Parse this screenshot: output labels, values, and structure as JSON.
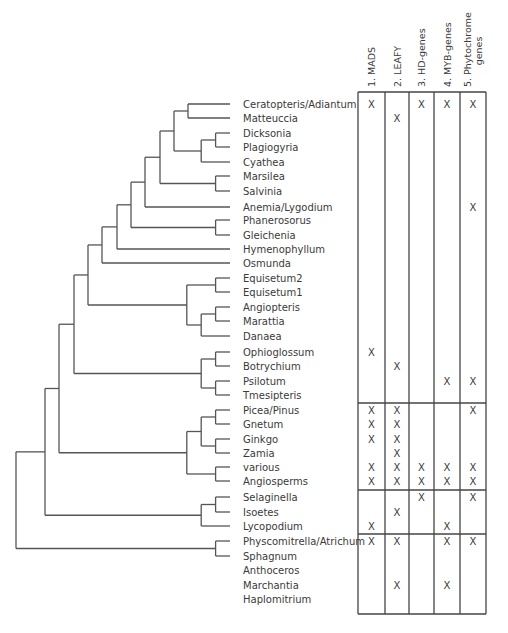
{
  "figure": {
    "type": "phylogenetic-tree-with-gene-matrix",
    "columns": [
      {
        "id": "mads",
        "label": "1. MADS"
      },
      {
        "id": "leafy",
        "label": "2. LEAFY"
      },
      {
        "id": "hd",
        "label": "3. HD-genes"
      },
      {
        "id": "myb",
        "label": "4. MYB-genes"
      },
      {
        "id": "phy",
        "label_line1": "5. Phytochrome",
        "label_line2": "genes"
      }
    ],
    "mark_symbol": "X",
    "taxa": [
      {
        "name": "Ceratopteris/Adiantum",
        "marks": [
          1,
          0,
          1,
          1,
          1
        ]
      },
      {
        "name": "Matteuccia",
        "marks": [
          0,
          1,
          0,
          0,
          0
        ]
      },
      {
        "name": "Dicksonia",
        "marks": [
          0,
          0,
          0,
          0,
          0
        ]
      },
      {
        "name": "Plagiogyria",
        "marks": [
          0,
          0,
          0,
          0,
          0
        ]
      },
      {
        "name": "Cyathea",
        "marks": [
          0,
          0,
          0,
          0,
          0
        ]
      },
      {
        "name": "Marsilea",
        "marks": [
          0,
          0,
          0,
          0,
          0
        ]
      },
      {
        "name": "Salvinia",
        "marks": [
          0,
          0,
          0,
          0,
          0
        ]
      },
      {
        "name": "Anemia/Lygodium",
        "marks": [
          0,
          0,
          0,
          0,
          1
        ]
      },
      {
        "name": "Phanerosorus",
        "marks": [
          0,
          0,
          0,
          0,
          0
        ]
      },
      {
        "name": "Gleichenia",
        "marks": [
          0,
          0,
          0,
          0,
          0
        ]
      },
      {
        "name": "Hymenophyllum",
        "marks": [
          0,
          0,
          0,
          0,
          0
        ]
      },
      {
        "name": "Osmunda",
        "marks": [
          0,
          0,
          0,
          0,
          0
        ]
      },
      {
        "name": "Equisetum2",
        "marks": [
          0,
          0,
          0,
          0,
          0
        ]
      },
      {
        "name": "Equisetum1",
        "marks": [
          0,
          0,
          0,
          0,
          0
        ]
      },
      {
        "name": "Angiopteris",
        "marks": [
          0,
          0,
          0,
          0,
          0
        ]
      },
      {
        "name": "Marattia",
        "marks": [
          0,
          0,
          0,
          0,
          0
        ]
      },
      {
        "name": "Danaea",
        "marks": [
          0,
          0,
          0,
          0,
          0
        ]
      },
      {
        "name": "Ophioglossum",
        "marks": [
          1,
          0,
          0,
          0,
          0
        ]
      },
      {
        "name": "Botrychium",
        "marks": [
          0,
          1,
          0,
          0,
          0
        ]
      },
      {
        "name": "Psilotum",
        "marks": [
          0,
          0,
          0,
          1,
          1
        ]
      },
      {
        "name": "Tmesipteris",
        "marks": [
          0,
          0,
          0,
          0,
          0
        ]
      },
      {
        "name": "Picea/Pinus",
        "marks": [
          1,
          1,
          0,
          0,
          1
        ]
      },
      {
        "name": "Gnetum",
        "marks": [
          1,
          1,
          0,
          0,
          0
        ]
      },
      {
        "name": "Ginkgo",
        "marks": [
          1,
          1,
          0,
          0,
          0
        ]
      },
      {
        "name": "Zamia",
        "marks": [
          0,
          1,
          0,
          0,
          0
        ]
      },
      {
        "name": "various",
        "marks": [
          1,
          1,
          1,
          1,
          1
        ]
      },
      {
        "name": "Angiosperms",
        "marks": [
          1,
          1,
          1,
          1,
          1
        ]
      },
      {
        "name": "Selaginella",
        "marks": [
          0,
          0,
          1,
          0,
          1
        ]
      },
      {
        "name": "Isoetes",
        "marks": [
          0,
          1,
          0,
          0,
          0
        ]
      },
      {
        "name": "Lycopodium",
        "marks": [
          1,
          0,
          0,
          1,
          0
        ]
      },
      {
        "name": "Physcomitrella/Atrichum",
        "marks": [
          1,
          1,
          0,
          1,
          1
        ]
      },
      {
        "name": "Sphagnum",
        "marks": [
          0,
          0,
          0,
          0,
          0
        ]
      },
      {
        "name": "Anthoceros",
        "marks": [
          0,
          0,
          0,
          0,
          0
        ]
      },
      {
        "name": "Marchantia",
        "marks": [
          0,
          1,
          0,
          1,
          0
        ]
      },
      {
        "name": "Haplomitrium",
        "marks": [
          0,
          0,
          0,
          0,
          0
        ]
      }
    ],
    "row_groups": [
      {
        "name": "ferns-and-allies",
        "from": "Ceratopteris/Adiantum",
        "to": "Tmesipteris"
      },
      {
        "name": "seed-plants",
        "from": "Picea/Pinus",
        "to": "Angiosperms"
      },
      {
        "name": "lycophytes",
        "from": "Selaginella",
        "to": "Lycopodium"
      },
      {
        "name": "bryophytes",
        "from": "Physcomitrella/Atrichum",
        "to": "Haplomitrium"
      }
    ],
    "tree_newick": "((((((((((((Ceratopteris/Adiantum,Matteuccia),((Dicksonia,Plagiogyria),Cyathea)),(Marsilea,Salvinia)),Anemia/Lygodium),(Phanerosorus,Gleichenia)),Hymenophyllum),Osmunda),((Equisetum2,Equisetum1),((Angiopteris,Marattia),Danaea))),((Ophioglossum,Botrychium),(Psilotum,Tmesipteris))),(((Picea/Pinus,Gnetum),(Ginkgo,Zamia)),(various,Angiosperms))),((Selaginella,Isoetes),Lycopodium)),(Physcomitrella/Atrichum,Sphagnum)),Anthoceros),(Marchantia,Haplomitrium));"
  }
}
